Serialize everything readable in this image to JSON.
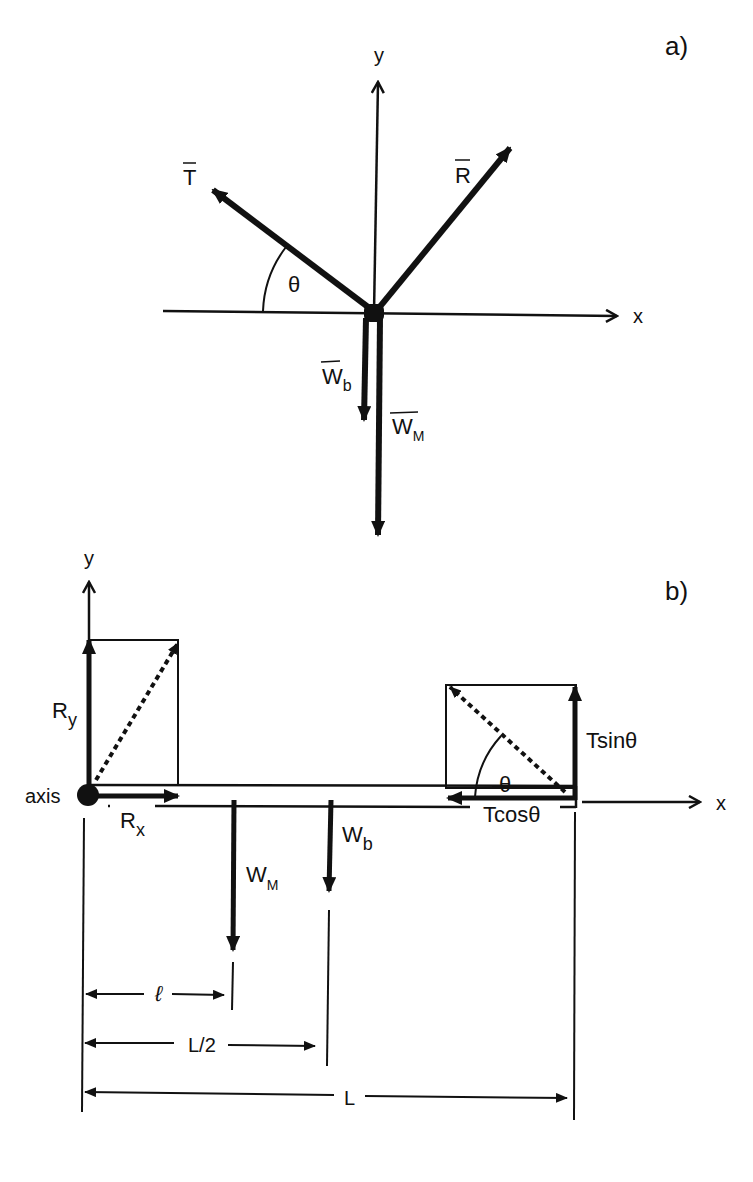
{
  "panel_a": {
    "label": "a)",
    "axis_y": "y",
    "axis_x": "x",
    "vectors": {
      "T": "T",
      "R": "R",
      "Wb_main": "W",
      "Wb_sub": "b",
      "WM_main": "W",
      "WM_sub": "M"
    },
    "angle": "θ"
  },
  "panel_b": {
    "label": "b)",
    "axis_y": "y",
    "axis_x": "x",
    "pivot_label": "axis",
    "Ry_main": "R",
    "Ry_sub": "y",
    "Rx_main": "R",
    "Rx_sub": "x",
    "WM_main": "W",
    "WM_sub": "M",
    "Wb_main": "W",
    "Wb_sub": "b",
    "tsin": "Tsinθ",
    "tcos": "Tcosθ",
    "angle": "θ",
    "dim_l": "ℓ",
    "dim_half": "L/2",
    "dim_L": "L"
  },
  "colors": {
    "ink": "#111111",
    "background": "#ffffff"
  }
}
